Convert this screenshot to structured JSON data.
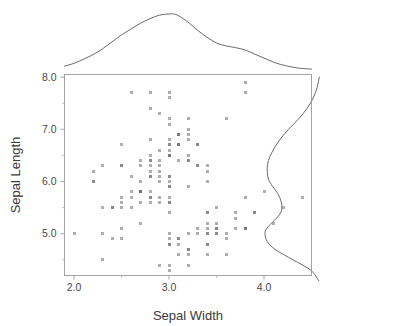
{
  "chart_data": {
    "type": "scatter",
    "title": "",
    "xlabel": "Sepal Width",
    "ylabel": "Sepal Length",
    "xlim": [
      1.9,
      4.5
    ],
    "ylim": [
      4.2,
      8.05
    ],
    "xticks": [
      2.0,
      3.0,
      4.0
    ],
    "xticklabels": [
      "2.0",
      "3.0",
      "4.0"
    ],
    "xticks_minor": [
      2.5,
      3.5
    ],
    "yticks": [
      5.0,
      6.0,
      7.0,
      8.0
    ],
    "yticklabels": [
      "5.0",
      "6.0",
      "7.0",
      "8.0"
    ],
    "yticks_minor": [
      4.5,
      5.5,
      6.5,
      7.5
    ],
    "grid": false,
    "legend": null,
    "marker": "square",
    "marker_color": "#6b6b75",
    "marker_size_px": 3,
    "marker_alpha": 0.55,
    "has_marginal_densities": true,
    "marginal_top": {
      "axis": "x",
      "type": "kde",
      "description": "Unimodal density of Sepal Width peaking near 3.05 with a slight right shoulder near 3.5",
      "x": [
        1.6,
        1.75,
        1.9,
        2.0,
        2.1,
        2.2,
        2.3,
        2.4,
        2.5,
        2.6,
        2.7,
        2.8,
        2.9,
        3.0,
        3.05,
        3.1,
        3.2,
        3.3,
        3.4,
        3.5,
        3.6,
        3.7,
        3.8,
        3.9,
        4.0,
        4.1,
        4.2,
        4.35,
        4.5,
        4.7,
        4.9
      ],
      "density": [
        0.02,
        0.05,
        0.1,
        0.15,
        0.22,
        0.3,
        0.4,
        0.52,
        0.64,
        0.74,
        0.84,
        0.92,
        0.98,
        1.0,
        1.0,
        0.97,
        0.86,
        0.72,
        0.6,
        0.5,
        0.45,
        0.42,
        0.38,
        0.31,
        0.24,
        0.17,
        0.12,
        0.07,
        0.05,
        0.03,
        0.02
      ]
    },
    "marginal_right": {
      "axis": "y",
      "type": "kde",
      "description": "Bimodal density of Sepal Length with a lower mode near 5.0 and a broad upper mode near 6.3",
      "y": [
        4.1,
        4.3,
        4.5,
        4.7,
        4.85,
        5.0,
        5.1,
        5.25,
        5.4,
        5.55,
        5.7,
        5.8,
        5.9,
        6.0,
        6.1,
        6.25,
        6.4,
        6.55,
        6.7,
        6.85,
        7.0,
        7.2,
        7.4,
        7.6,
        7.8,
        8.0,
        8.2
      ],
      "density": [
        0.04,
        0.18,
        0.5,
        0.82,
        0.96,
        1.0,
        0.97,
        0.84,
        0.72,
        0.7,
        0.74,
        0.79,
        0.86,
        0.92,
        0.95,
        0.96,
        0.94,
        0.88,
        0.8,
        0.7,
        0.58,
        0.4,
        0.25,
        0.14,
        0.07,
        0.03,
        0.01
      ]
    },
    "points": [
      [
        3.5,
        5.1
      ],
      [
        3.0,
        4.9
      ],
      [
        3.2,
        4.7
      ],
      [
        3.1,
        4.6
      ],
      [
        3.6,
        5.0
      ],
      [
        3.9,
        5.4
      ],
      [
        3.4,
        4.6
      ],
      [
        3.4,
        5.0
      ],
      [
        2.9,
        4.4
      ],
      [
        3.1,
        4.9
      ],
      [
        3.7,
        5.4
      ],
      [
        3.4,
        4.8
      ],
      [
        3.0,
        4.8
      ],
      [
        3.0,
        4.3
      ],
      [
        4.0,
        5.8
      ],
      [
        4.4,
        5.7
      ],
      [
        3.9,
        5.4
      ],
      [
        3.5,
        5.1
      ],
      [
        3.8,
        5.7
      ],
      [
        3.8,
        5.1
      ],
      [
        3.4,
        5.4
      ],
      [
        3.7,
        5.1
      ],
      [
        3.6,
        4.6
      ],
      [
        3.3,
        5.1
      ],
      [
        3.4,
        4.8
      ],
      [
        3.0,
        5.0
      ],
      [
        3.4,
        5.0
      ],
      [
        3.5,
        5.2
      ],
      [
        3.4,
        5.2
      ],
      [
        3.2,
        4.7
      ],
      [
        3.1,
        4.8
      ],
      [
        3.4,
        5.4
      ],
      [
        4.1,
        5.2
      ],
      [
        4.2,
        5.5
      ],
      [
        3.1,
        4.9
      ],
      [
        3.2,
        5.0
      ],
      [
        3.5,
        5.5
      ],
      [
        3.6,
        4.9
      ],
      [
        3.0,
        4.4
      ],
      [
        3.4,
        5.1
      ],
      [
        3.5,
        5.0
      ],
      [
        2.3,
        4.5
      ],
      [
        3.2,
        4.4
      ],
      [
        3.5,
        5.0
      ],
      [
        3.8,
        5.1
      ],
      [
        3.0,
        4.8
      ],
      [
        3.8,
        5.1
      ],
      [
        3.2,
        4.6
      ],
      [
        3.7,
        5.3
      ],
      [
        3.3,
        5.0
      ],
      [
        3.2,
        7.0
      ],
      [
        3.2,
        6.4
      ],
      [
        3.1,
        6.9
      ],
      [
        2.3,
        5.5
      ],
      [
        2.8,
        6.5
      ],
      [
        2.8,
        5.7
      ],
      [
        3.3,
        6.3
      ],
      [
        2.4,
        4.9
      ],
      [
        2.9,
        6.6
      ],
      [
        2.7,
        5.2
      ],
      [
        2.0,
        5.0
      ],
      [
        3.0,
        5.9
      ],
      [
        2.2,
        6.0
      ],
      [
        2.9,
        6.1
      ],
      [
        2.9,
        5.6
      ],
      [
        3.1,
        6.7
      ],
      [
        3.0,
        5.6
      ],
      [
        2.7,
        5.8
      ],
      [
        2.2,
        6.2
      ],
      [
        2.5,
        5.6
      ],
      [
        3.2,
        5.9
      ],
      [
        2.8,
        6.1
      ],
      [
        2.5,
        6.3
      ],
      [
        2.8,
        6.1
      ],
      [
        2.9,
        6.4
      ],
      [
        3.0,
        6.6
      ],
      [
        2.8,
        6.8
      ],
      [
        3.0,
        6.7
      ],
      [
        2.9,
        6.0
      ],
      [
        2.6,
        5.7
      ],
      [
        2.4,
        5.5
      ],
      [
        2.4,
        5.5
      ],
      [
        2.7,
        5.8
      ],
      [
        2.7,
        6.0
      ],
      [
        3.0,
        5.4
      ],
      [
        3.4,
        6.0
      ],
      [
        3.1,
        6.7
      ],
      [
        2.3,
        6.3
      ],
      [
        3.0,
        5.6
      ],
      [
        2.5,
        5.5
      ],
      [
        2.6,
        5.5
      ],
      [
        3.0,
        6.1
      ],
      [
        2.6,
        5.8
      ],
      [
        2.3,
        5.0
      ],
      [
        2.7,
        5.6
      ],
      [
        3.0,
        5.7
      ],
      [
        2.9,
        5.7
      ],
      [
        2.9,
        6.2
      ],
      [
        2.5,
        5.1
      ],
      [
        2.8,
        5.7
      ],
      [
        3.3,
        6.3
      ],
      [
        2.7,
        5.8
      ],
      [
        3.0,
        7.1
      ],
      [
        2.9,
        6.3
      ],
      [
        3.0,
        6.5
      ],
      [
        3.0,
        7.6
      ],
      [
        2.5,
        4.9
      ],
      [
        2.9,
        7.3
      ],
      [
        2.5,
        6.7
      ],
      [
        3.6,
        7.2
      ],
      [
        3.2,
        6.5
      ],
      [
        2.7,
        6.4
      ],
      [
        3.0,
        6.8
      ],
      [
        2.5,
        5.7
      ],
      [
        2.8,
        5.8
      ],
      [
        3.2,
        6.4
      ],
      [
        3.0,
        6.5
      ],
      [
        3.8,
        7.7
      ],
      [
        2.6,
        7.7
      ],
      [
        2.2,
        6.0
      ],
      [
        3.2,
        6.9
      ],
      [
        2.8,
        5.6
      ],
      [
        2.8,
        7.7
      ],
      [
        2.7,
        6.3
      ],
      [
        3.3,
        6.7
      ],
      [
        3.2,
        7.2
      ],
      [
        2.8,
        6.2
      ],
      [
        3.0,
        6.1
      ],
      [
        2.8,
        6.4
      ],
      [
        3.0,
        7.2
      ],
      [
        2.8,
        7.4
      ],
      [
        3.8,
        7.9
      ],
      [
        2.8,
        6.4
      ],
      [
        2.8,
        6.3
      ],
      [
        2.6,
        6.1
      ],
      [
        3.0,
        7.7
      ],
      [
        3.4,
        6.3
      ],
      [
        3.1,
        6.4
      ],
      [
        3.0,
        6.0
      ],
      [
        3.1,
        6.9
      ],
      [
        3.1,
        6.7
      ],
      [
        3.1,
        6.9
      ],
      [
        2.7,
        5.8
      ],
      [
        3.2,
        6.8
      ],
      [
        3.3,
        6.7
      ],
      [
        3.0,
        6.7
      ],
      [
        2.5,
        6.3
      ],
      [
        3.0,
        6.5
      ],
      [
        3.4,
        6.2
      ],
      [
        3.0,
        5.9
      ]
    ]
  },
  "figure": {
    "background": "#ffffff",
    "axis_color": "#9a9a9a",
    "text_color": "#3a3a3a",
    "curve_color": "#555a60",
    "point_color": "#6b6b75"
  }
}
